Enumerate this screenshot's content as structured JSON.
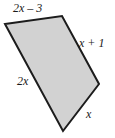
{
  "figure": {
    "name": "quadrilateral-with-side-expressions",
    "shape_type": "quadrilateral",
    "fill_color": "#d2d2d2",
    "stroke_color": "#1c1c1c",
    "stroke_width": 2,
    "background_color": "#ffffff",
    "vertices": [
      {
        "name": "top-left",
        "x": 5,
        "y": 24
      },
      {
        "name": "top-right",
        "x": 62,
        "y": 16
      },
      {
        "name": "right",
        "x": 99,
        "y": 84
      },
      {
        "name": "bottom",
        "x": 63,
        "y": 131
      }
    ],
    "points_attr": "5,24 62,16 99,84 63,131"
  },
  "labels": {
    "top": "2x – 3",
    "right": "x + 1",
    "left": "2x",
    "bottom": "x"
  }
}
